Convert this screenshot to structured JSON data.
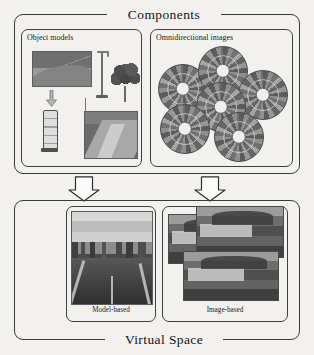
{
  "figure": {
    "background_color": "#f2f1ee",
    "line_color": "#3a3a3a"
  },
  "components_section": {
    "title": "Components",
    "panels": [
      {
        "label": "Object models",
        "contents": [
          "terrain-thumbnail",
          "street-lamp-model",
          "tree-model",
          "traffic-signal-model",
          "road-thumbnail",
          "downward-arrow"
        ]
      },
      {
        "label": "Omnidirectional images",
        "contents": [
          "fisheye-image-1",
          "fisheye-image-2",
          "fisheye-image-3",
          "fisheye-image-4",
          "fisheye-image-5",
          "fisheye-image-6"
        ]
      }
    ]
  },
  "flow": {
    "arrows": [
      {
        "name": "arrow-object-models-to-model-based",
        "direction": "down"
      },
      {
        "name": "arrow-omni-images-to-image-based",
        "direction": "down"
      }
    ]
  },
  "virtual_space_section": {
    "title": "Virtual Space",
    "panels": [
      {
        "caption": "Model-based",
        "contents": [
          "rendered-street-scene"
        ]
      },
      {
        "caption": "Image-based",
        "contents": [
          "photo-mosaic-1",
          "photo-mosaic-2",
          "photo-mosaic-3"
        ]
      }
    ]
  }
}
